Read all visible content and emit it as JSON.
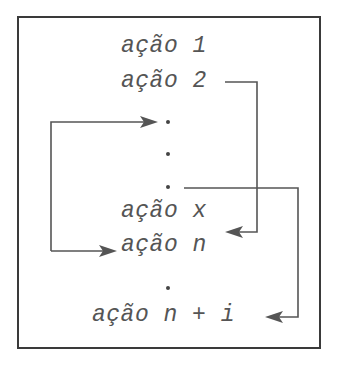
{
  "diagram": {
    "type": "control-flow-jumps",
    "colors": {
      "line": "#555555",
      "text": "#555555",
      "frame": "#3a3a3a",
      "background": "#ffffff"
    },
    "actions": [
      {
        "id": "a1",
        "label": "ação 1"
      },
      {
        "id": "a2",
        "label": "ação 2"
      },
      {
        "id": "ax",
        "label": "ação x"
      },
      {
        "id": "an",
        "label": "ação n"
      },
      {
        "id": "ani",
        "label": "ação n + i"
      }
    ],
    "ellipsis_dots": 4,
    "edges": [
      {
        "from": "ação 2",
        "to": "ação x",
        "direction": "forward"
      },
      {
        "from": "left-loop",
        "to": "first dot",
        "direction": "into"
      },
      {
        "from": "left-loop",
        "to": "ação n",
        "direction": "into"
      },
      {
        "from": "third dot",
        "to": "ação n + i",
        "direction": "forward"
      }
    ]
  }
}
